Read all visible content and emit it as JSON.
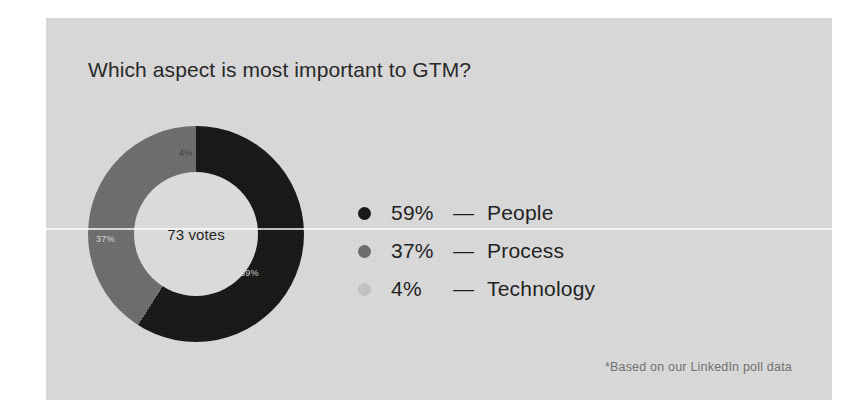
{
  "card": {
    "background_color": "#d9d9d9",
    "title": "Which aspect is most important to GTM?",
    "footnote": "*Based on our LinkedIn poll data"
  },
  "chart_data": {
    "type": "pie",
    "variant": "donut",
    "title": "Which aspect is most important to GTM?",
    "center_label": "73 votes",
    "total_votes": 73,
    "unit": "%",
    "legend_position": "right",
    "categories": [
      "People",
      "Process",
      "Technology"
    ],
    "values": [
      59,
      37,
      4
    ],
    "slice_labels": [
      "59%",
      "37%",
      "4%"
    ],
    "colors": [
      "#141414",
      "#6b6b6b",
      "#c2c2c2"
    ],
    "annotations": [
      "*Based on our LinkedIn poll data"
    ],
    "series": [
      {
        "name": "GTM poll",
        "points": [
          {
            "label": "People",
            "value": 59,
            "display": "59%",
            "color": "#141414"
          },
          {
            "label": "Process",
            "value": 37,
            "display": "37%",
            "color": "#6b6b6b"
          },
          {
            "label": "Technology",
            "value": 4,
            "display": "4%",
            "color": "#c2c2c2"
          }
        ]
      }
    ]
  },
  "legend": {
    "rows": [
      {
        "pct": "59%",
        "dash": "—",
        "name": "People",
        "color": "#141414"
      },
      {
        "pct": "37%",
        "dash": "—",
        "name": "Process",
        "color": "#6b6b6b"
      },
      {
        "pct": "4%",
        "dash": "—",
        "name": "Technology",
        "color": "#c2c2c2"
      }
    ]
  },
  "donut": {
    "center_text": "73 votes",
    "label_people": "59%",
    "label_process": "37%",
    "label_technology": "4%"
  }
}
